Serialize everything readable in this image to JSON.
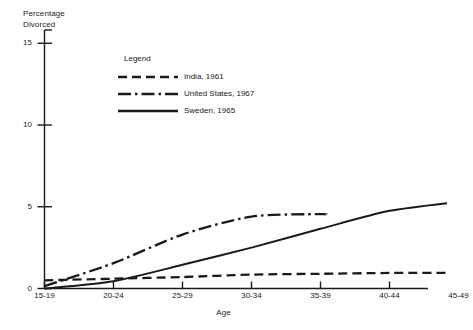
{
  "chart_data": {
    "type": "line",
    "title": "",
    "ylabel": "Percentage\nDivorced",
    "xlabel": "Age",
    "categories": [
      "15-19",
      "20-24",
      "25-29",
      "30-34",
      "35-39",
      "40-44",
      "45-49"
    ],
    "yticks": [
      0,
      5,
      10,
      15
    ],
    "ylim": [
      0,
      15
    ],
    "grid": false,
    "legend_title": "Legend",
    "legend_position": "inside-upper-center",
    "series": [
      {
        "name": "India, 1961",
        "style": "dashed",
        "color": "#1a1a1a",
        "values": [
          0.5,
          0.6,
          0.7,
          0.85,
          0.9,
          0.95,
          0.95
        ]
      },
      {
        "name": "United States, 1967",
        "style": "dash-dot",
        "color": "#1a1a1a",
        "values": [
          0.15,
          1.55,
          3.3,
          4.4,
          4.55,
          null,
          null
        ]
      },
      {
        "name": "Sweden, 1965",
        "style": "solid",
        "color": "#1a1a1a",
        "values": [
          0.0,
          0.45,
          1.45,
          2.5,
          3.65,
          4.75,
          5.3
        ]
      }
    ]
  },
  "ytick_labels": [
    "0",
    "5",
    "10",
    "15"
  ],
  "axis": {
    "y_title": "Percentage\nDivorced",
    "x_title": "Age"
  },
  "legend": {
    "title": "Legend",
    "items": [
      {
        "label": "India, 1961"
      },
      {
        "label": "United States, 1967"
      },
      {
        "label": "Sweden, 1965"
      }
    ]
  }
}
